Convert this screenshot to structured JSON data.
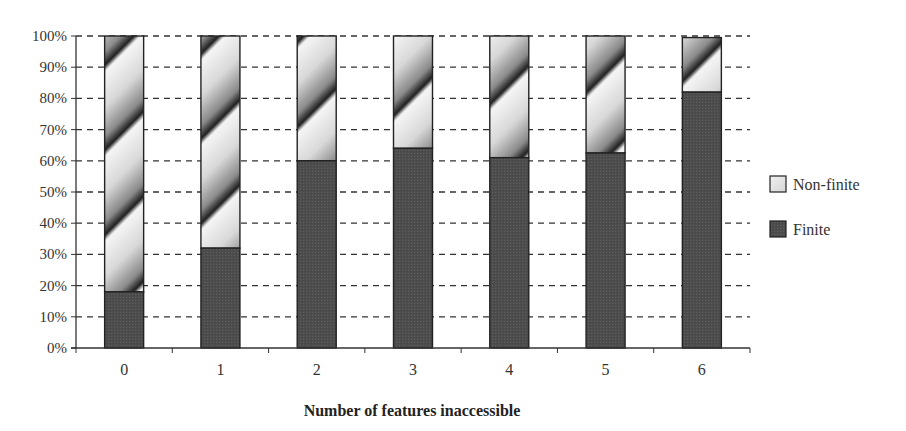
{
  "chart_data": {
    "type": "bar",
    "stacked": true,
    "normalized_percent": true,
    "title": "",
    "xlabel": "Number of features inaccessible",
    "ylabel": "",
    "categories": [
      "0",
      "1",
      "2",
      "3",
      "4",
      "5",
      "6"
    ],
    "series": [
      {
        "name": "Finite",
        "values": [
          18,
          32,
          60,
          64,
          61,
          62.5,
          82
        ],
        "color": "#555555",
        "pattern": "solid-dark"
      },
      {
        "name": "Non-finite",
        "values": [
          82,
          68,
          40,
          36,
          39,
          37.5,
          17.5
        ],
        "color": "#d9d9d9",
        "pattern": "diagonal-gradient"
      }
    ],
    "ylim": [
      0,
      100
    ],
    "yticks": [
      "0%",
      "10%",
      "20%",
      "30%",
      "40%",
      "50%",
      "60%",
      "70%",
      "80%",
      "90%",
      "100%"
    ],
    "grid": {
      "y": true,
      "style": "dashed"
    },
    "legend": {
      "position": "right",
      "entries": [
        "Non-finite",
        "Finite"
      ]
    }
  }
}
